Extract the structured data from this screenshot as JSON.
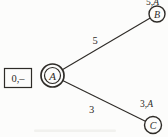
{
  "colors": {
    "ink": "#2e2b27",
    "background": "#fcfcfb",
    "node_fill": "#fcfcfb",
    "artifact": "#edecE8"
  },
  "start_box": {
    "label": "0,–"
  },
  "nodes": {
    "a": {
      "letter": "A"
    },
    "b": {
      "letter": "B"
    },
    "c": {
      "letter": "C"
    }
  },
  "edges": {
    "ab": {
      "weight": "5"
    },
    "ac": {
      "weight": "3"
    }
  },
  "labels": {
    "b": {
      "distance": "5,",
      "via": "A"
    },
    "c": {
      "distance": "3,",
      "via": "A"
    }
  }
}
